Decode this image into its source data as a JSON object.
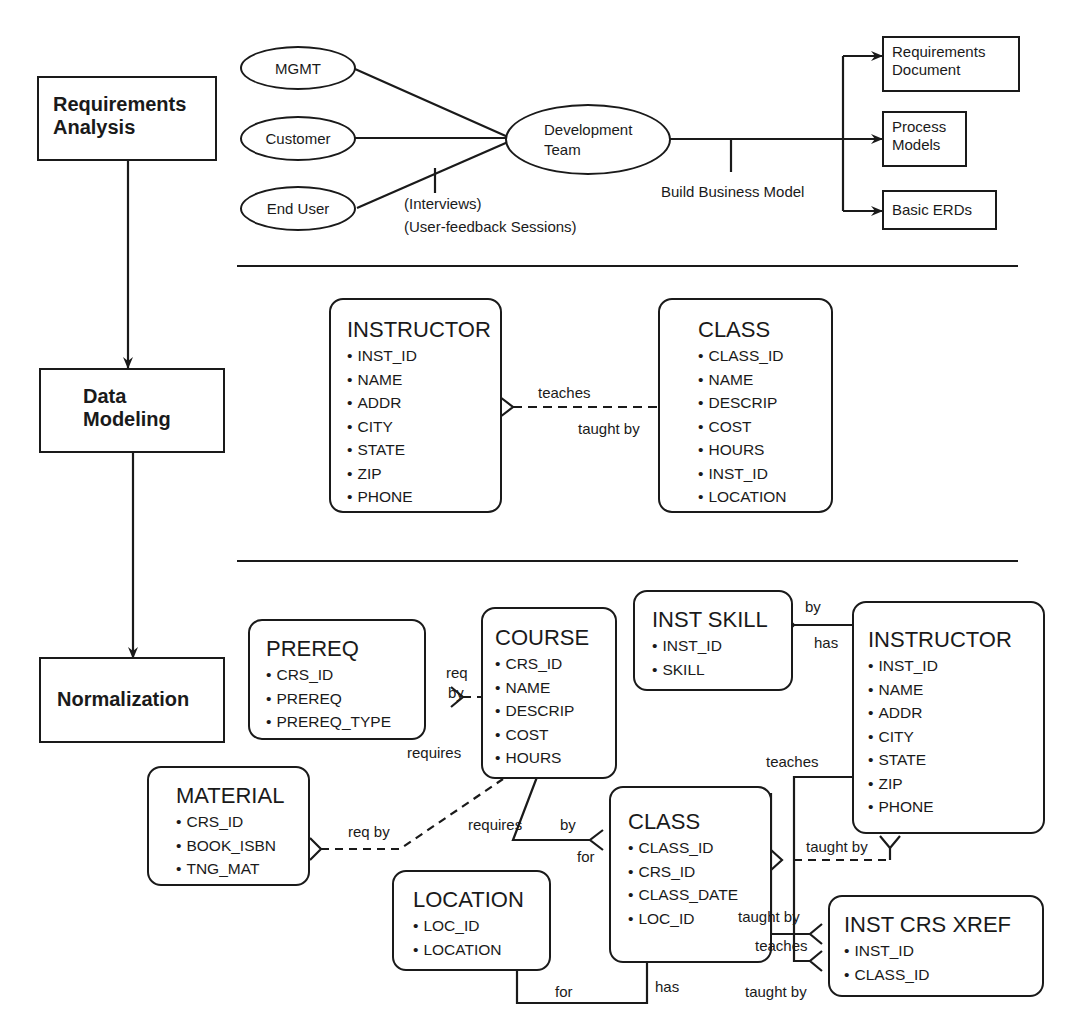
{
  "phases": [
    {
      "id": "requirements",
      "label_lines": [
        "Requirements",
        "Analysis"
      ]
    },
    {
      "id": "data-modeling",
      "label_lines": [
        "Data",
        "Modeling"
      ]
    },
    {
      "id": "normalization",
      "label_lines": [
        "Normalization"
      ]
    }
  ],
  "requirements": {
    "stakeholders": [
      "MGMT",
      "Customer",
      "End User"
    ],
    "hub": [
      "Development",
      "Team"
    ],
    "interview_labels": [
      "(Interviews)",
      "(User-feedback Sessions)"
    ],
    "build_label": "Build Business Model",
    "outputs": [
      {
        "lines": [
          "Requirements",
          "Document"
        ]
      },
      {
        "lines": [
          "Process",
          "Models"
        ]
      },
      {
        "lines": [
          "Basic ERDs"
        ]
      }
    ]
  },
  "data_modeling": {
    "entities": [
      {
        "name": "INSTRUCTOR",
        "fields": [
          "INST_ID",
          "NAME",
          "ADDR",
          "CITY",
          "STATE",
          "ZIP",
          "PHONE"
        ]
      },
      {
        "name": "CLASS",
        "fields": [
          "CLASS_ID",
          "NAME",
          "DESCRIP",
          "COST",
          "HOURS",
          "INST_ID",
          "LOCATION"
        ]
      }
    ],
    "relationship": {
      "forward": "teaches",
      "reverse": "taught by"
    }
  },
  "normalization": {
    "entities": {
      "prereq": {
        "name": "PREREQ",
        "fields": [
          "CRS_ID",
          "PREREQ",
          "PREREQ_TYPE"
        ]
      },
      "course": {
        "name": "COURSE",
        "fields": [
          "CRS_ID",
          "NAME",
          "DESCRIP",
          "COST",
          "HOURS"
        ]
      },
      "inst_skill": {
        "name": "INST SKILL",
        "fields": [
          "INST_ID",
          "SKILL"
        ]
      },
      "instructor": {
        "name": "INSTRUCTOR",
        "fields": [
          "INST_ID",
          "NAME",
          "ADDR",
          "CITY",
          "STATE",
          "ZIP",
          "PHONE"
        ]
      },
      "material": {
        "name": "MATERIAL",
        "fields": [
          "CRS_ID",
          "BOOK_ISBN",
          "TNG_MAT"
        ]
      },
      "class": {
        "name": "CLASS",
        "fields": [
          "CLASS_ID",
          "CRS_ID",
          "CLASS_DATE",
          "LOC_ID"
        ]
      },
      "location": {
        "name": "LOCATION",
        "fields": [
          "LOC_ID",
          "LOCATION"
        ]
      },
      "inst_crs_xref": {
        "name": "INST CRS XREF",
        "fields": [
          "INST_ID",
          "CLASS_ID"
        ]
      }
    },
    "labels": {
      "req": "req",
      "by_prereq": "by",
      "requires_prereq": "requires",
      "by_skill": "by",
      "has_skill": "has",
      "req_by_material": "req by",
      "requires_class": "requires",
      "by_class": "by",
      "for_class": "for",
      "teaches_instr": "teaches",
      "taught_by_instr": "taught by",
      "taught_by_xref1": "taught by",
      "teaches_xref": "teaches",
      "taught_by_xref2": "taught by",
      "for_location": "for",
      "has_location": "has"
    }
  }
}
